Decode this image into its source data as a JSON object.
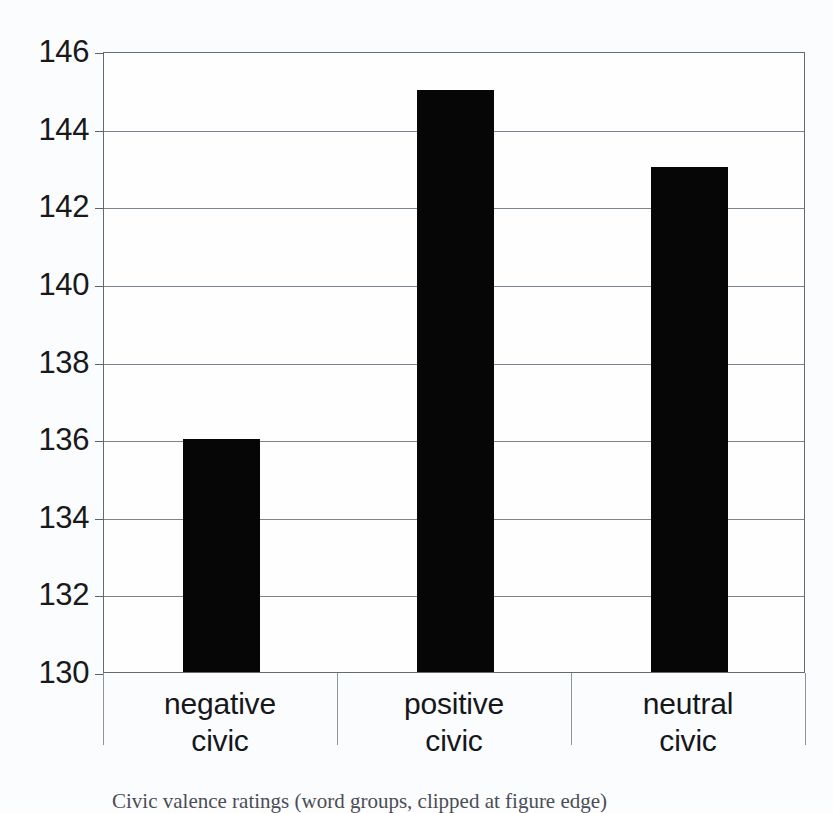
{
  "chart_data": {
    "type": "bar",
    "title": "",
    "subtitle": "",
    "xlabel": "",
    "ylabel": "",
    "categories": [
      "negative civic",
      "positive civic",
      "neutral civic"
    ],
    "category_lines": [
      [
        "negative",
        "civic"
      ],
      [
        "positive",
        "civic"
      ],
      [
        "neutral",
        "civic"
      ]
    ],
    "values": [
      136,
      145,
      143
    ],
    "series": [
      {
        "name": "",
        "values": [
          136,
          145,
          143
        ]
      }
    ],
    "ylim": [
      130,
      146
    ],
    "ytick_step": 2,
    "ytick_labels": [
      "146",
      "144",
      "142",
      "140",
      "138",
      "136",
      "134",
      "132",
      "130"
    ],
    "ytick_values": [
      146,
      144,
      142,
      140,
      138,
      136,
      134,
      132,
      130
    ],
    "grid": true,
    "legend": "none",
    "bar_color": "#060607",
    "grid_color": "#7b838c",
    "axis_color": "#636a72",
    "background_color": "#fbfcfe"
  },
  "caption": {
    "text": "Civic valence ratings (word groups, clipped at figure edge)"
  }
}
